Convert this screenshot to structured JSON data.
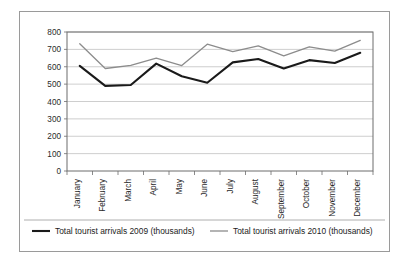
{
  "chart_data": {
    "type": "line",
    "title": "",
    "xlabel": "",
    "ylabel": "",
    "ylim": [
      0,
      800
    ],
    "ytick_step": 100,
    "yticks": [
      "0",
      "100",
      "200",
      "300",
      "400",
      "500",
      "600",
      "700",
      "800"
    ],
    "grid": true,
    "legend_position": "bottom",
    "categories": [
      "January",
      "February",
      "March",
      "April",
      "May",
      "June",
      "July",
      "August",
      "September",
      "October",
      "November",
      "December"
    ],
    "series": [
      {
        "name": "Total tourist arrivals 2009 (thousands)",
        "color": "#1a1a1a",
        "values": [
          605,
          490,
          495,
          618,
          545,
          508,
          625,
          645,
          590,
          638,
          622,
          680
        ]
      },
      {
        "name": "Total tourist arrivals 2010 (thousands)",
        "color": "#8c8c8c",
        "values": [
          732,
          590,
          608,
          650,
          607,
          730,
          687,
          720,
          663,
          715,
          690,
          752
        ]
      }
    ]
  },
  "legend": {
    "items": [
      {
        "label": "Total tourist arrivals 2009 (thousands)",
        "swatch": "line-swatch-dark"
      },
      {
        "label": "Total tourist arrivals 2010 (thousands)",
        "swatch": "line-swatch-gray"
      }
    ]
  },
  "colors": {
    "series_2009": "#1a1a1a",
    "series_2010": "#8c8c8c",
    "gridline": "#b9b9b9",
    "axis": "#6d6d6d",
    "frame": "#9a9a9a",
    "background": "#ffffff"
  }
}
